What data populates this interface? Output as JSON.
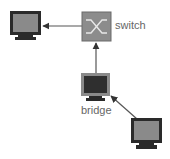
{
  "diagram": {
    "nodes": [
      {
        "id": "pc-left",
        "type": "computer"
      },
      {
        "id": "switch",
        "type": "switch",
        "label": "switch"
      },
      {
        "id": "bridge",
        "type": "computer",
        "label": "bridge"
      },
      {
        "id": "pc-bottom-right",
        "type": "computer"
      }
    ],
    "edges": [
      {
        "from": "switch",
        "to": "pc-left"
      },
      {
        "from": "bridge",
        "to": "switch"
      },
      {
        "from": "pc-bottom-right",
        "to": "bridge"
      }
    ]
  },
  "colors": {
    "monitor_frame": "#2a2a2a",
    "screen_light": "#8a8a8a",
    "screen_dark": "#3a3a3a",
    "switch_fill": "#8c8c8c",
    "line": "#444444",
    "label": "#666666"
  }
}
